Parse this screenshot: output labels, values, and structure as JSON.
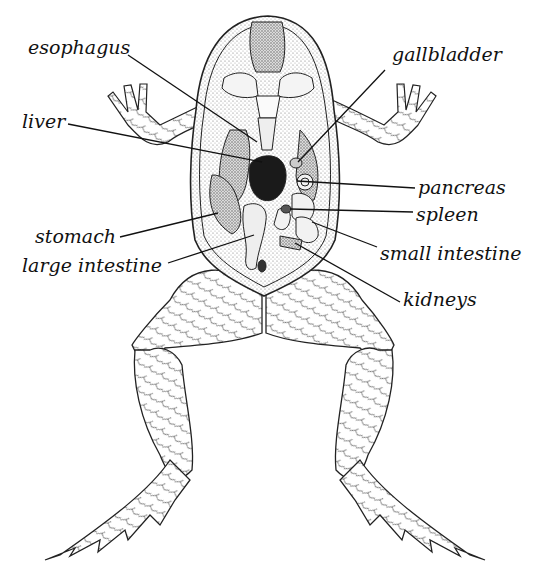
{
  "diagram": {
    "colors": {
      "ink": "#111111",
      "background": "#ffffff",
      "stipple": "#9a9a9a",
      "liver_dark": "#1a1a1a"
    },
    "labels": [
      {
        "id": "esophagus",
        "text": "esophagus",
        "x": 28,
        "y": 38,
        "anchor_from": [
          128,
          55
        ],
        "anchor_to": [
          257,
          142
        ]
      },
      {
        "id": "liver",
        "text": "liver",
        "x": 22,
        "y": 112,
        "anchor_from": [
          68,
          124
        ],
        "anchor_to": [
          262,
          162
        ]
      },
      {
        "id": "stomach",
        "text": "stomach",
        "x": 35,
        "y": 227,
        "anchor_from": [
          120,
          237
        ],
        "anchor_to": [
          218,
          213
        ]
      },
      {
        "id": "large-intestine",
        "text": "large intestine",
        "x": 22,
        "y": 256,
        "anchor_from": [
          168,
          263
        ],
        "anchor_to": [
          254,
          235
        ]
      },
      {
        "id": "gallbladder",
        "text": "gallbladder",
        "x": 392,
        "y": 45,
        "anchor_from": [
          385,
          70
        ],
        "anchor_to": [
          298,
          162
        ]
      },
      {
        "id": "pancreas",
        "text": "pancreas",
        "x": 418,
        "y": 178,
        "anchor_from": [
          415,
          188
        ],
        "anchor_to": [
          297,
          181
        ]
      },
      {
        "id": "spleen",
        "text": "spleen",
        "x": 416,
        "y": 205,
        "anchor_from": [
          413,
          212
        ],
        "anchor_to": [
          290,
          209
        ]
      },
      {
        "id": "small-intestine",
        "text": "small intestine",
        "x": 380,
        "y": 244,
        "anchor_from": [
          377,
          247
        ],
        "anchor_to": [
          312,
          222
        ]
      },
      {
        "id": "kidneys",
        "text": "kidneys",
        "x": 403,
        "y": 290,
        "anchor_from": [
          400,
          302
        ],
        "anchor_to": [
          295,
          243
        ]
      }
    ]
  }
}
